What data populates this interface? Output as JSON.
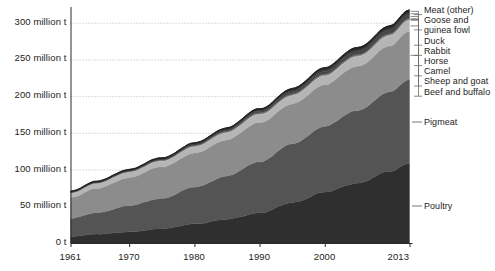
{
  "chart_data": {
    "type": "area",
    "title": "",
    "subtitle": "",
    "xlabel": "",
    "ylabel": "",
    "stacked": true,
    "grid": true,
    "legend_position": "right",
    "xlim": [
      1961,
      2013
    ],
    "ylim": [
      0,
      320
    ],
    "y_unit": "million t",
    "x_ticks": [
      "1961",
      "1970",
      "1980",
      "1990",
      "2000",
      "2013"
    ],
    "x_tick_values": [
      1961,
      1970,
      1980,
      1990,
      2000,
      2013
    ],
    "y_ticks": [
      "0 t",
      "50 million t",
      "100 million t",
      "150 million t",
      "200 million t",
      "250 million t",
      "300 million t"
    ],
    "y_tick_values": [
      0,
      50,
      100,
      150,
      200,
      250,
      300
    ],
    "x": [
      1961,
      1965,
      1970,
      1975,
      1980,
      1985,
      1990,
      1995,
      2000,
      2005,
      2010,
      2013
    ],
    "series": [
      {
        "name": "Poultry",
        "color": "#2f2f2f",
        "values": [
          8.9,
          12.1,
          15.1,
          19.4,
          25.9,
          32.4,
          41.0,
          54.8,
          69.3,
          81.6,
          97.4,
          108.7
        ]
      },
      {
        "name": "Pigmeat",
        "color": "#545454",
        "values": [
          24.8,
          29.0,
          35.8,
          41.4,
          49.9,
          58.9,
          69.8,
          79.9,
          89.7,
          99.2,
          108.0,
          114.4
        ]
      },
      {
        "name": "Beef and buffalo",
        "color": "#8c8c8c",
        "values": [
          28.5,
          33.0,
          38.4,
          43.0,
          46.1,
          49.6,
          53.4,
          54.2,
          56.9,
          59.8,
          62.6,
          65.5
        ]
      },
      {
        "name": "Sheep and goat",
        "color": "#b5b5b5",
        "values": [
          5.9,
          6.5,
          7.3,
          7.7,
          8.5,
          9.7,
          10.7,
          11.1,
          11.9,
          13.0,
          13.8,
          14.8
        ]
      },
      {
        "name": "Camel",
        "color": "#c9c9c9",
        "values": [
          0.25,
          0.28,
          0.32,
          0.36,
          0.4,
          0.44,
          0.48,
          0.52,
          0.55,
          0.58,
          0.62,
          0.65
        ]
      },
      {
        "name": "Horse",
        "color": "#a0a0a0",
        "values": [
          0.45,
          0.5,
          0.54,
          0.58,
          0.62,
          0.65,
          0.68,
          0.7,
          0.72,
          0.74,
          0.76,
          0.78
        ]
      },
      {
        "name": "Rabbit",
        "color": "#6e6e6e",
        "values": [
          0.5,
          0.6,
          0.72,
          0.86,
          1.0,
          1.15,
          1.3,
          1.4,
          1.5,
          1.6,
          1.7,
          1.75
        ]
      },
      {
        "name": "Duck",
        "color": "#454545",
        "values": [
          0.35,
          0.45,
          0.6,
          0.8,
          1.1,
          1.5,
          2.1,
          2.9,
          3.5,
          4.0,
          4.3,
          4.5
        ]
      },
      {
        "name": "Goose and guinea fowl",
        "color": "#3a3a3a",
        "values": [
          0.15,
          0.2,
          0.27,
          0.38,
          0.55,
          0.78,
          1.05,
          1.6,
          2.1,
          2.4,
          2.6,
          2.8
        ]
      },
      {
        "name": "Meat (other)",
        "color": "#262626",
        "values": [
          1.2,
          1.35,
          1.5,
          1.7,
          1.95,
          2.2,
          2.5,
          2.8,
          3.1,
          3.4,
          3.7,
          3.9
        ]
      }
    ],
    "legend_entries": [
      {
        "label": "Meat (other)",
        "label_line2": ""
      },
      {
        "label": "Goose and",
        "label_line2": "guinea fowl"
      },
      {
        "label": "Duck",
        "label_line2": ""
      },
      {
        "label": "Rabbit",
        "label_line2": ""
      },
      {
        "label": "Horse",
        "label_line2": ""
      },
      {
        "label": "Camel",
        "label_line2": ""
      },
      {
        "label": "Sheep and goat",
        "label_line2": ""
      },
      {
        "label": "Beef and buffalo",
        "label_line2": ""
      }
    ],
    "inline_labels": [
      {
        "label": "Pigmeat"
      },
      {
        "label": "Poultry"
      }
    ],
    "colors": {
      "grid": "#b9b9b9",
      "axis": "#2b2b2b",
      "text": "#1d1d1d",
      "leader": "#6a6a6a",
      "background": "#ffffff"
    }
  }
}
